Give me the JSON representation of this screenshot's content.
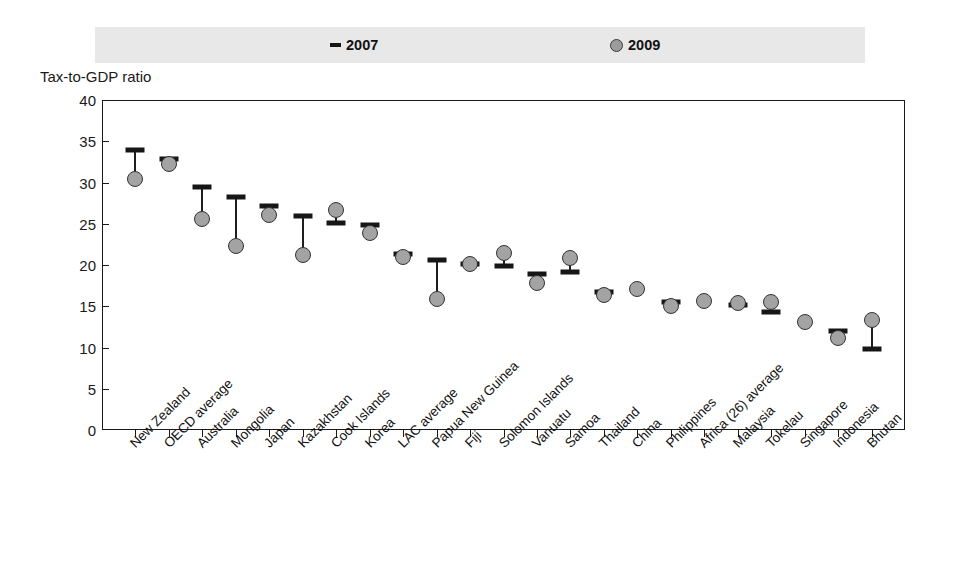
{
  "legend": {
    "series_2007_label": "2007",
    "series_2009_label": "2009",
    "marker_2007": "dash-marker",
    "marker_2009": "circle-marker",
    "background_color": "#e8e8e8"
  },
  "axis_title": "Tax-to-GDP ratio",
  "chart_data": {
    "type": "scatter",
    "title": "",
    "subtitle": "",
    "xlabel": "",
    "ylabel": "Tax-to-GDP ratio",
    "ylim": [
      0,
      40
    ],
    "yticks": [
      0,
      5,
      10,
      15,
      20,
      25,
      30,
      35,
      40
    ],
    "grid": false,
    "legend_position": "top",
    "colors": {
      "series_2007": "#161616",
      "series_2009": "#a3a3a3",
      "series_2009_edge": "#333333",
      "axis": "#1a1a1a",
      "legend_background": "#e8e8e8"
    },
    "categories": [
      "New Zealand",
      "OECD average",
      "Australia",
      "Mongolia",
      "Japan",
      "Kazakhstan",
      "Cook Islands",
      "Korea",
      "LAC average",
      "Papua New Guinea",
      "Fiji",
      "Solomon Islands",
      "Vanuatu",
      "Samoa",
      "Thailand",
      "China",
      "Philippines",
      "Africa (26) average",
      "Malaysia",
      "Tokelau",
      "Singapore",
      "Indonesia",
      "Bhutan"
    ],
    "series": [
      {
        "name": "2007",
        "marker": "dash",
        "values": [
          34.0,
          32.8,
          29.5,
          28.3,
          27.2,
          26.0,
          25.1,
          24.8,
          21.3,
          20.6,
          20.1,
          19.9,
          18.9,
          19.1,
          16.7,
          null,
          15.5,
          null,
          15.2,
          14.3,
          null,
          12.0,
          9.8
        ]
      },
      {
        "name": "2009",
        "marker": "circle",
        "values": [
          30.4,
          32.3,
          25.6,
          22.3,
          26.1,
          21.2,
          26.7,
          23.9,
          21.0,
          15.9,
          20.1,
          21.5,
          17.8,
          20.8,
          16.4,
          17.1,
          15.0,
          15.6,
          15.4,
          15.5,
          13.1,
          11.2,
          13.3
        ]
      }
    ]
  }
}
